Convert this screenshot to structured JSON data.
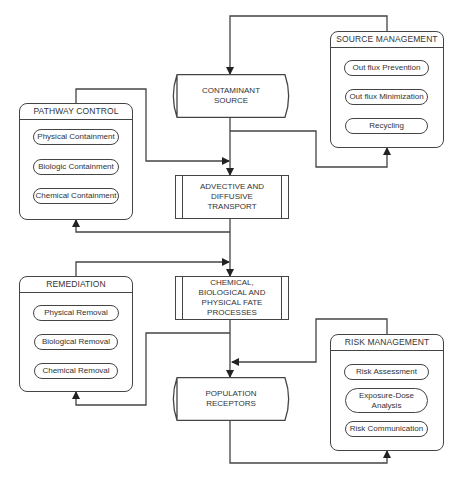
{
  "diagram": {
    "central_flow": [
      {
        "id": "contaminant_source",
        "label": "CONTAMINANT\nSOURCE",
        "shape": "cylinder"
      },
      {
        "id": "advective_transport",
        "label": "ADVECTIVE AND\nDIFFUSIVE\nTRANSPORT",
        "shape": "predefined-process"
      },
      {
        "id": "fate_processes",
        "label": "CHEMICAL,\nBIOLOGICAL AND\nPHYSICAL FATE\nPROCESSES",
        "shape": "predefined-process"
      },
      {
        "id": "population_receptors",
        "label": "POPULATION\nRECEPTORS",
        "shape": "cylinder"
      }
    ],
    "groups": {
      "source_management": {
        "title": "SOURCE MANAGEMENT",
        "items": [
          "Out flux Prevention",
          "Out flux Minimization",
          "Recycling"
        ]
      },
      "pathway_control": {
        "title": "PATHWAY CONTROL",
        "items": [
          "Physical Containment",
          "Biologic Containment",
          "Chemical Containment"
        ]
      },
      "remediation": {
        "title": "REMEDIATION",
        "items": [
          "Physical Removal",
          "Biological Removal",
          "Chemical Removal"
        ]
      },
      "risk_management": {
        "title": "RISK MANAGEMENT",
        "items": [
          "Risk Assessment",
          "Exposure-Dose\nAnalysis",
          "Risk Communication"
        ]
      }
    },
    "edges": [
      {
        "from": "source_management",
        "to": "contaminant_source"
      },
      {
        "from": "contaminant_source",
        "to": "advective_transport"
      },
      {
        "from": "contaminant_source",
        "to": "source_management"
      },
      {
        "from": "pathway_control",
        "to": "advective_transport"
      },
      {
        "from": "advective_transport",
        "to": "fate_processes"
      },
      {
        "from": "advective_transport",
        "to": "pathway_control"
      },
      {
        "from": "remediation",
        "to": "fate_processes"
      },
      {
        "from": "fate_processes",
        "to": "population_receptors"
      },
      {
        "from": "fate_processes",
        "to": "remediation"
      },
      {
        "from": "risk_management",
        "to": "population_receptors"
      },
      {
        "from": "population_receptors",
        "to": "risk_management"
      }
    ],
    "colors": {
      "line": "#444444",
      "text": "#333333",
      "background": "#ffffff"
    }
  }
}
